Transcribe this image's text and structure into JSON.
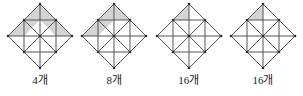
{
  "figures": [
    {
      "id": "figure-1",
      "caption": "4개",
      "count": 4,
      "shaded_regions": [
        "36,4 4,36 20,36 36,20",
        "36,4 36,20 52,36 68,36"
      ]
    },
    {
      "id": "figure-2",
      "caption": "8개",
      "count": 8,
      "shaded_regions": [
        "36,4 4,36 20,36 36,20",
        "36,4 36,20 52,20"
      ]
    },
    {
      "id": "figure-3",
      "caption": "16개",
      "count": 16,
      "shaded_regions": [
        "36,4 20,20 36,20"
      ]
    },
    {
      "id": "figure-4",
      "caption": "16개",
      "count": 16,
      "shaded_regions": [
        "36,4 20,20 36,20"
      ]
    }
  ],
  "geometry": {
    "outer_diamond": "36,4 68,36 36,68 4,36",
    "inner_square": "20,20 52,20 52,52 20,52",
    "lines": [
      "4,36 68,36",
      "36,4 36,68",
      "20,20 52,52",
      "52,20 20,52",
      "36,4 20,20",
      "36,4 52,20",
      "4,36 20,20",
      "4,36 20,52",
      "68,36 52,20",
      "68,36 52,52",
      "36,68 20,52",
      "36,68 52,52"
    ],
    "vertices": [
      "36,4",
      "68,36",
      "36,68",
      "4,36",
      "20,20",
      "52,20",
      "52,52",
      "20,52",
      "36,36"
    ]
  },
  "colors": {
    "stroke": "#555555",
    "shade_fill": "#d4d4d4",
    "vertex_dot": "#2b2b2b",
    "caption_text": "#1a1a1a",
    "background": "#ffffff"
  }
}
